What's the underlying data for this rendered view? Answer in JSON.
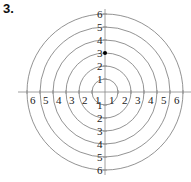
{
  "problem": {
    "number": "3."
  },
  "diagram": {
    "type": "polar-grid",
    "center": [
      105,
      92
    ],
    "unit_px": 13,
    "rings": [
      1,
      2,
      3,
      4,
      5,
      6
    ],
    "ring_color": "#777777",
    "axis_color": "#888888",
    "tick_labels": {
      "up": [
        "1",
        "2",
        "3",
        "4",
        "5",
        "6"
      ],
      "down": [
        "1",
        "2",
        "3",
        "4",
        "5",
        "6"
      ],
      "left": [
        "1",
        "2",
        "3",
        "4",
        "5",
        "6"
      ],
      "right": [
        "1",
        "2",
        "3",
        "4",
        "5",
        "6"
      ]
    },
    "points": [
      {
        "label": "point",
        "r": 3,
        "theta_deg": 90,
        "color": "#000000"
      }
    ]
  }
}
